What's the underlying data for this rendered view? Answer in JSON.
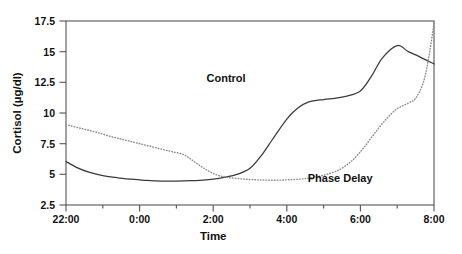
{
  "chart_data": {
    "type": "line",
    "title": "",
    "xlabel": "Time",
    "ylabel": "Cortisol  (µg/dl)",
    "ylim": [
      2.5,
      17.5
    ],
    "yticks": [
      2.5,
      5,
      7.5,
      10,
      12.5,
      15,
      17.5
    ],
    "ytick_labels": [
      "2.5",
      "5",
      "7.5",
      "10",
      "12.5",
      "15",
      "17.5"
    ],
    "xlim_hours": [
      22,
      32
    ],
    "xticks_major": [
      "22:00",
      "0:00",
      "2:00",
      "4:00",
      "6:00",
      "8:00"
    ],
    "xtick_label_right_edge": "8:00",
    "xtick_minor_count": 5,
    "grid": false,
    "legend_position": "inline-annotations",
    "series": [
      {
        "name": "Control",
        "style": "solid",
        "color": "#3a3a3a",
        "label_x_hour": 26.35,
        "label_y_value": 12.55,
        "x": [
          22.0,
          22.3,
          22.6,
          23.0,
          23.4,
          23.8,
          0.2,
          0.6,
          1.0,
          1.4,
          1.8,
          2.2,
          2.6,
          3.0,
          3.3,
          3.6,
          4.0,
          4.3,
          4.6,
          5.0,
          5.3,
          5.6,
          6.0,
          6.3,
          6.6,
          7.0,
          7.3,
          7.6,
          8.0
        ],
        "y": [
          6.05,
          5.55,
          5.2,
          4.9,
          4.72,
          4.6,
          4.5,
          4.45,
          4.45,
          4.48,
          4.55,
          4.7,
          4.95,
          5.5,
          6.5,
          7.8,
          9.5,
          10.4,
          10.9,
          11.1,
          11.2,
          11.35,
          11.8,
          13.0,
          14.5,
          15.5,
          15.0,
          14.6,
          14.0
        ]
      },
      {
        "name": "Phase Delay",
        "style": "dotted",
        "color": "#8a8a8a",
        "label_x_hour": 29.45,
        "label_y_value": 4.35,
        "x": [
          22.0,
          22.4,
          22.8,
          23.2,
          23.6,
          0.0,
          0.4,
          0.8,
          1.2,
          1.5,
          1.8,
          2.1,
          2.4,
          2.8,
          3.2,
          3.6,
          4.0,
          4.4,
          4.8,
          5.2,
          5.5,
          5.8,
          6.1,
          6.4,
          6.7,
          7.0,
          7.3,
          7.5,
          7.7,
          7.85,
          8.0
        ],
        "y": [
          9.05,
          8.75,
          8.45,
          8.1,
          7.8,
          7.5,
          7.2,
          6.9,
          6.6,
          6.0,
          5.4,
          4.95,
          4.75,
          4.62,
          4.55,
          4.52,
          4.55,
          4.62,
          4.8,
          5.1,
          5.5,
          6.2,
          7.2,
          8.4,
          9.5,
          10.35,
          10.8,
          11.2,
          12.4,
          14.4,
          17.3
        ]
      }
    ]
  }
}
